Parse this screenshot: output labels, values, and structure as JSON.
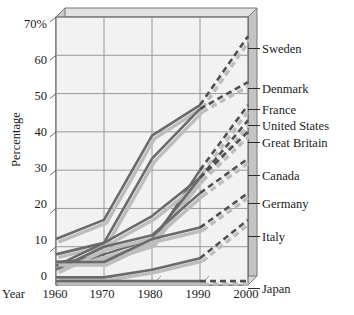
{
  "axes": {
    "ylabel": "Percentage",
    "year_word": "Year",
    "yticks": [
      "70%",
      "60",
      "50",
      "40",
      "30",
      "20",
      "10",
      "0"
    ],
    "xticks": [
      "1960",
      "1970",
      "1980",
      "1990",
      "2000"
    ]
  },
  "colors": {
    "line": "#6a6a6a",
    "shadow": "#bdbdbd",
    "grid": "#8e8e8e",
    "wall": "#f2f2f2",
    "frame_side": "#c9c9c9",
    "frame_top": "#e2e2e2",
    "text": "#1a1a1a"
  },
  "chart_data": {
    "type": "line",
    "title": "",
    "xlabel": "Year",
    "ylabel": "Percentage",
    "x": [
      1960,
      1970,
      1980,
      1990,
      2000
    ],
    "xlim": [
      1960,
      2000
    ],
    "ylim": [
      0,
      70
    ],
    "yticks": [
      0,
      10,
      20,
      30,
      40,
      50,
      60,
      70
    ],
    "grid": true,
    "legend": "right-end-labels",
    "dashed_from": 1990,
    "note": "Last segment (1990-2000) drawn dashed (projected) for every series.",
    "series": [
      {
        "name": "Sweden",
        "values": [
          12,
          17,
          39,
          47,
          65
        ]
      },
      {
        "name": "Denmark",
        "values": [
          8,
          11,
          33,
          46,
          53
        ]
      },
      {
        "name": "France",
        "values": [
          6,
          7,
          11,
          30,
          47
        ]
      },
      {
        "name": "United States",
        "values": [
          5,
          11,
          18,
          28,
          43
        ]
      },
      {
        "name": "Great Britain",
        "values": [
          5,
          8,
          12,
          28,
          40
        ]
      },
      {
        "name": "Canada",
        "values": [
          4,
          10,
          13,
          24,
          33
        ]
      },
      {
        "name": "Germany",
        "values": [
          6,
          6,
          12,
          15,
          24
        ]
      },
      {
        "name": "Italy",
        "values": [
          2,
          2,
          4,
          7,
          17
        ]
      },
      {
        "name": "Japan",
        "values": [
          1,
          1,
          1,
          1,
          1
        ]
      }
    ]
  },
  "series_labels": [
    {
      "name": "Sweden",
      "y": 43
    },
    {
      "name": "Denmark",
      "y": 83
    },
    {
      "name": "France",
      "y": 104
    },
    {
      "name": "United States",
      "y": 120
    },
    {
      "name": "Great Britain",
      "y": 137
    },
    {
      "name": "Canada",
      "y": 170
    },
    {
      "name": "Germany",
      "y": 198
    },
    {
      "name": "Italy",
      "y": 231
    },
    {
      "name": "Japan",
      "y": 283
    }
  ]
}
